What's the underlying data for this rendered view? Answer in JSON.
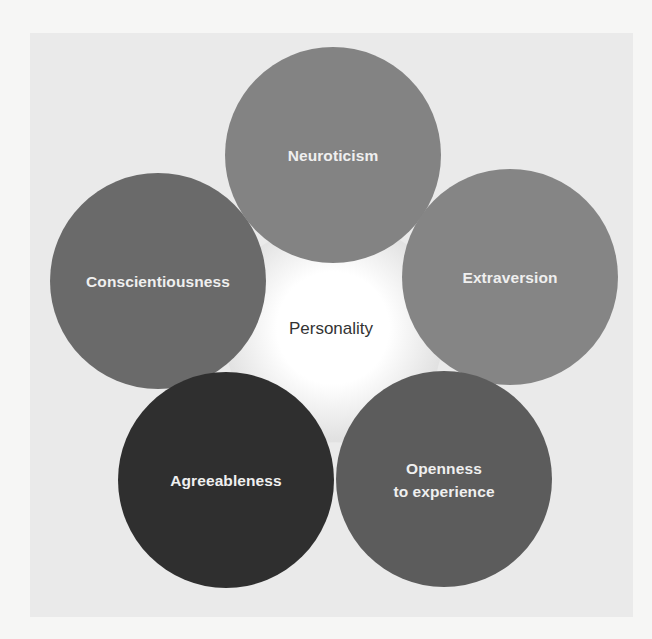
{
  "diagram": {
    "center": {
      "label": "Personality"
    },
    "traits": [
      {
        "label": "Neuroticism",
        "color": "#838383"
      },
      {
        "label": "Extraversion",
        "color": "#858585"
      },
      {
        "label": "Openness\nto experience",
        "color": "#5c5c5c"
      },
      {
        "label": "Agreeableness",
        "color": "#2f2f2f"
      },
      {
        "label": "Conscientiousness",
        "color": "#6a6a6a"
      }
    ]
  },
  "colors": {
    "page_background": "#f6f6f5",
    "panel_background": "#eaeaea",
    "center_glow": "#ffffff",
    "trait_text": "#efefef",
    "center_text": "#333333"
  }
}
